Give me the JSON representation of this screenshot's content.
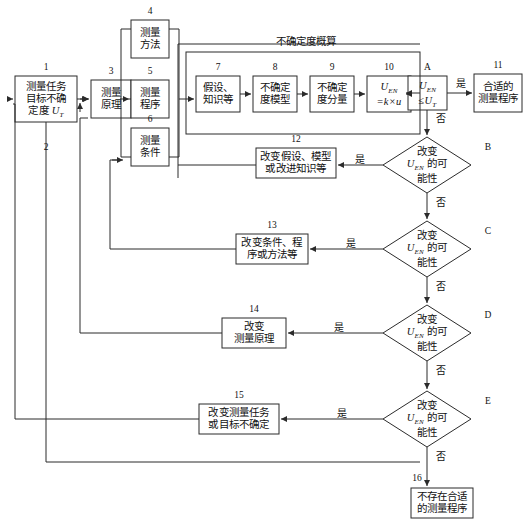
{
  "diagram": {
    "title_group": "不确定度概算",
    "nodes": [
      {
        "id": "n1",
        "num": "1",
        "text": "测量任务\n目标不确\n定度 UT",
        "shape": "rect"
      },
      {
        "id": "n3",
        "num": "3",
        "text": "测量\n原理",
        "shape": "rect"
      },
      {
        "id": "n4",
        "num": "4",
        "text": "测量\n方法",
        "shape": "rect"
      },
      {
        "id": "n5",
        "num": "5",
        "text": "测量\n程序",
        "shape": "rect"
      },
      {
        "id": "n6",
        "num": "6",
        "text": "测量\n条件",
        "shape": "rect"
      },
      {
        "id": "n7",
        "num": "7",
        "text": "假设、\n知识等",
        "shape": "rect"
      },
      {
        "id": "n8",
        "num": "8",
        "text": "不确定\n度模型",
        "shape": "rect"
      },
      {
        "id": "n9",
        "num": "9",
        "text": "不确定\n度分量",
        "shape": "rect"
      },
      {
        "id": "n10",
        "num": "10",
        "text": "UEN\n=k×u",
        "shape": "rect"
      },
      {
        "id": "nA",
        "num": "A",
        "text": "UEN\n≤UT",
        "shape": "rect"
      },
      {
        "id": "n11",
        "num": "11",
        "text": "合适的\n测量程序",
        "shape": "rect"
      },
      {
        "id": "n12",
        "num": "12",
        "text": "改变假设、模型\n或改进知识等",
        "shape": "rect"
      },
      {
        "id": "n13",
        "num": "13",
        "text": "改变条件、程\n序或方法等",
        "shape": "rect"
      },
      {
        "id": "n14",
        "num": "14",
        "text": "改变\n测量原理",
        "shape": "rect"
      },
      {
        "id": "n15",
        "num": "15",
        "text": "改变测量任务\n或目标不确定",
        "shape": "rect"
      },
      {
        "id": "n16",
        "num": "16",
        "text": "不存在合适\n的测量程序",
        "shape": "rect"
      },
      {
        "id": "dB",
        "num": "B",
        "text": "改变\nUEN 的可\n能性",
        "shape": "diamond"
      },
      {
        "id": "dC",
        "num": "C",
        "text": "改变\nUEN 的可\n能性",
        "shape": "diamond"
      },
      {
        "id": "dD",
        "num": "D",
        "text": "改变\nUEN 的可\n能性",
        "shape": "diamond"
      },
      {
        "id": "dE",
        "num": "E",
        "text": "改变\nUEN 的可\n能性",
        "shape": "diamond"
      }
    ],
    "edge_labels": {
      "a_yes": "是",
      "a_no": "否",
      "b_yes": "是",
      "b_no": "否",
      "c_yes": "是",
      "c_no": "否",
      "d_yes": "是",
      "d_no": "否",
      "e_yes": "是",
      "e_no": "否"
    },
    "standalone_numbers": {
      "two": "2"
    },
    "colors": {
      "stroke": "#2b2b2b",
      "text": "#111111",
      "background": "#ffffff"
    }
  }
}
